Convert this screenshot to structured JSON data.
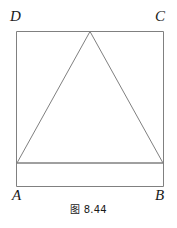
{
  "figure": {
    "caption": "图 8.44",
    "stroke_color": "#808080",
    "label_color": "#1a1a1a",
    "background_color": "#ffffff",
    "stroke_width": 1,
    "vertices": {
      "A": "A",
      "B": "B",
      "C": "C",
      "D": "D"
    },
    "shapes": {
      "square": {
        "name": "square-ABCD",
        "points": "16,31 164,31 164,187 16,187"
      },
      "triangle": {
        "name": "isosceles-triangle",
        "points": "90,31 163,163 17,163"
      },
      "base_line": {
        "name": "triangle-base-line",
        "x1": 16,
        "y1": 163,
        "x2": 164,
        "y2": 163
      }
    }
  }
}
